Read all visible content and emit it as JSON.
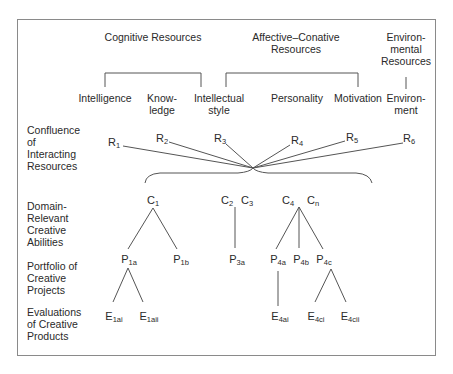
{
  "diagram": {
    "resource_groups": [
      {
        "id": "cognitive",
        "label": "Cognitive Resources"
      },
      {
        "id": "affective",
        "label": "Affective–Conative\nResources"
      },
      {
        "id": "environmental",
        "label": "Environ-\nmental\nResources"
      }
    ],
    "resources": [
      {
        "id": "intelligence",
        "label": "Intelligence"
      },
      {
        "id": "knowledge",
        "label": "Know-\nledge"
      },
      {
        "id": "intellectual_style",
        "label": "Intellectual\nstyle"
      },
      {
        "id": "personality",
        "label": "Personality"
      },
      {
        "id": "motivation",
        "label": "Motivation"
      },
      {
        "id": "environment",
        "label": "Environ-\nment"
      }
    ],
    "row_labels": [
      {
        "id": "confluence",
        "label": "Confluence\nof\nInteracting\nResources"
      },
      {
        "id": "domain",
        "label": "Domain-\nRelevant\nCreative\nAbilities"
      },
      {
        "id": "portfolio",
        "label": "Portfolio of\nCreative\nProjects"
      },
      {
        "id": "evaluations",
        "label": "Evaluations\nof Creative\nProducts"
      }
    ],
    "r_nodes": [
      {
        "base": "R",
        "sub": "1"
      },
      {
        "base": "R",
        "sub": "2"
      },
      {
        "base": "R",
        "sub": "3"
      },
      {
        "base": "R",
        "sub": "4"
      },
      {
        "base": "R",
        "sub": "5"
      },
      {
        "base": "R",
        "sub": "6"
      }
    ],
    "c_nodes": [
      {
        "base": "C",
        "sub": "1"
      },
      {
        "base": "C",
        "sub": "2"
      },
      {
        "base": "C",
        "sub": "3"
      },
      {
        "base": "C",
        "sub": "4"
      },
      {
        "base": "C",
        "sub": "n"
      }
    ],
    "p_nodes": [
      {
        "base": "P",
        "sub": "1a"
      },
      {
        "base": "P",
        "sub": "1b"
      },
      {
        "base": "P",
        "sub": "3a"
      },
      {
        "base": "P",
        "sub": "4a"
      },
      {
        "base": "P",
        "sub": "4b"
      },
      {
        "base": "P",
        "sub": "4c"
      }
    ],
    "e_nodes": [
      {
        "base": "E",
        "sub": "1ai"
      },
      {
        "base": "E",
        "sub": "1aii"
      },
      {
        "base": "E",
        "sub": "4ai"
      },
      {
        "base": "E",
        "sub": "4ci"
      },
      {
        "base": "E",
        "sub": "4cii"
      }
    ]
  }
}
